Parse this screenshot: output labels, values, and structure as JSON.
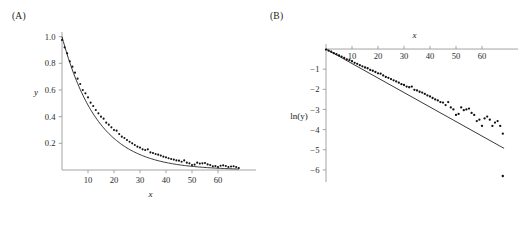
{
  "figure": {
    "panels": [
      {
        "label": "(A)",
        "xlabel": "x",
        "ylabel": "y",
        "x_axis_position": "bottom",
        "y_axis_position": "left"
      },
      {
        "label": "(B)",
        "xlabel": "x",
        "ylabel": "ln(y)",
        "x_axis_position": "top",
        "y_axis_position": "left"
      }
    ]
  },
  "chart_data": [
    {
      "type": "scatter",
      "title": "(A)",
      "xlabel": "x",
      "ylabel": "y",
      "xlim": [
        0,
        70
      ],
      "ylim": [
        0,
        1.05
      ],
      "xticks": [
        10,
        20,
        30,
        40,
        50,
        60
      ],
      "yticks": [
        0.2,
        0.4,
        0.6,
        0.8,
        1.0
      ],
      "xticklabels": [
        "10",
        "20",
        "30",
        "40",
        "50",
        "60"
      ],
      "yticklabels": [
        "0.2",
        "0.4",
        "0.6",
        "0.8",
        "1.0"
      ],
      "grid": false,
      "legend": null,
      "series": [
        {
          "name": "data",
          "kind": "points",
          "x": [
            0,
            1,
            2,
            3,
            4,
            5,
            6,
            7,
            8,
            9,
            10,
            11,
            12,
            13,
            14,
            15,
            16,
            17,
            18,
            19,
            20,
            21,
            22,
            23,
            24,
            25,
            26,
            27,
            28,
            29,
            30,
            31,
            32,
            33,
            34,
            35,
            36,
            37,
            38,
            39,
            40,
            41,
            42,
            43,
            44,
            45,
            46,
            47,
            48,
            49,
            50,
            51,
            52,
            53,
            54,
            55,
            56,
            57,
            58,
            59,
            60,
            61,
            62,
            63,
            64,
            65,
            66,
            67,
            68
          ],
          "y": [
            0.975,
            0.92,
            0.875,
            0.815,
            0.775,
            0.73,
            0.685,
            0.645,
            0.6,
            0.575,
            0.545,
            0.505,
            0.48,
            0.45,
            0.425,
            0.4,
            0.385,
            0.355,
            0.34,
            0.32,
            0.3,
            0.295,
            0.27,
            0.25,
            0.24,
            0.225,
            0.212,
            0.2,
            0.188,
            0.175,
            0.168,
            0.155,
            0.15,
            0.155,
            0.132,
            0.128,
            0.12,
            0.115,
            0.108,
            0.1,
            0.095,
            0.088,
            0.082,
            0.078,
            0.072,
            0.07,
            0.062,
            0.072,
            0.055,
            0.05,
            0.038,
            0.04,
            0.055,
            0.048,
            0.05,
            0.052,
            0.042,
            0.038,
            0.028,
            0.03,
            0.022,
            0.032,
            0.035,
            0.03,
            0.022,
            0.026,
            0.028,
            0.022,
            0.015
          ]
        },
        {
          "name": "fitted exponential curve",
          "kind": "line",
          "model": "y = exp(-0.072 x)"
        }
      ]
    },
    {
      "type": "scatter",
      "title": "(B)",
      "xlabel": "x",
      "ylabel": "ln(y)",
      "xlim": [
        0,
        70
      ],
      "ylim": [
        -6.6,
        0.25
      ],
      "xticks": [
        10,
        20,
        30,
        40,
        50,
        60
      ],
      "yticks": [
        -1,
        -2,
        -3,
        -4,
        -5,
        -6
      ],
      "xticklabels": [
        "10",
        "20",
        "30",
        "40",
        "50",
        "60"
      ],
      "yticklabels": [
        "−1",
        "−2",
        "−3",
        "−4",
        "−5",
        "−6"
      ],
      "grid": false,
      "legend": null,
      "series": [
        {
          "name": "ln(data)",
          "kind": "points",
          "x": [
            0,
            1,
            2,
            3,
            4,
            5,
            6,
            7,
            8,
            9,
            10,
            11,
            12,
            13,
            14,
            15,
            16,
            17,
            18,
            19,
            20,
            21,
            22,
            23,
            24,
            25,
            26,
            27,
            28,
            29,
            30,
            31,
            32,
            33,
            34,
            35,
            36,
            37,
            38,
            39,
            40,
            41,
            42,
            43,
            44,
            45,
            46,
            47,
            48,
            49,
            50,
            51,
            52,
            53,
            54,
            55,
            56,
            57,
            58,
            59,
            60,
            61,
            62,
            63,
            64,
            65,
            66,
            67,
            68
          ],
          "y": [
            -0.025,
            -0.083,
            -0.134,
            -0.205,
            -0.255,
            -0.315,
            -0.378,
            -0.439,
            -0.511,
            -0.553,
            -0.607,
            -0.683,
            -0.734,
            -0.799,
            -0.856,
            -0.916,
            -0.954,
            -1.036,
            -1.078,
            -1.139,
            -1.204,
            -1.221,
            -1.309,
            -1.386,
            -1.427,
            -1.491,
            -1.551,
            -1.609,
            -1.671,
            -1.743,
            -1.784,
            -1.864,
            -1.897,
            -1.864,
            -2.025,
            -2.056,
            -2.12,
            -2.163,
            -2.226,
            -2.303,
            -2.354,
            -2.43,
            -2.501,
            -2.551,
            -2.631,
            -2.659,
            -2.781,
            -2.631,
            -2.9,
            -2.996,
            -3.27,
            -3.219,
            -2.9,
            -3.037,
            -2.996,
            -2.957,
            -3.17,
            -3.27,
            -3.576,
            -3.507,
            -3.817,
            -3.442,
            -3.352,
            -3.507,
            -3.817,
            -3.65,
            -3.576,
            -3.817,
            -4.2
          ]
        },
        {
          "name": "least-squares fit line",
          "kind": "line",
          "model": "ln(y) = -0.072 x",
          "slope": -0.072,
          "intercept": 0
        }
      ]
    }
  ]
}
